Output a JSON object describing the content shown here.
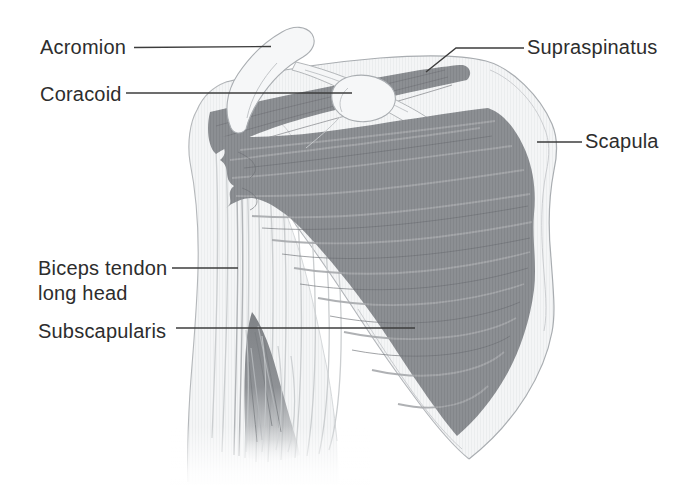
{
  "figure": {
    "labels": {
      "acromion": "Acromion",
      "coracoid": "Coracoid",
      "supraspinatus": "Supraspinatus",
      "scapula": "Scapula",
      "biceps_line1": "Biceps tendon",
      "biceps_line2": "long head",
      "subscapularis": "Subscapularis"
    },
    "colors": {
      "background": "#ffffff",
      "muscle": "#8c8f93",
      "muscle_fiber_light": "#a6a9ac",
      "muscle_fiber_dark": "#6f7276",
      "bone_fill": "#f4f5f6",
      "bone_outline": "#a9adb1",
      "leader_line": "#3c3c3c",
      "text": "#2d2d2d"
    }
  }
}
